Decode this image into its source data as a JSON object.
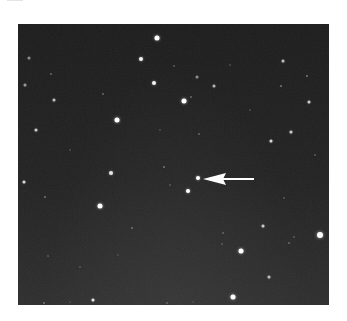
{
  "image": {
    "subject": "star field with arrow marking a single object",
    "panel": {
      "x": 18,
      "y": 24,
      "width": 311,
      "height": 281,
      "background": "#202020"
    },
    "arrow": {
      "direction": "left",
      "color": "#ffffff",
      "tip": {
        "x": 203,
        "y": 179
      },
      "head_base_x": 226,
      "head_half_height": 6,
      "shaft_end_x": 254,
      "shaft_thickness": 2
    },
    "target_star": {
      "x": 198,
      "y": 178,
      "size": 4
    },
    "stars": [
      {
        "x": 157,
        "y": 38,
        "size": 5,
        "brightness": 1.0
      },
      {
        "x": 141,
        "y": 59,
        "size": 4,
        "brightness": 0.95
      },
      {
        "x": 154,
        "y": 83,
        "size": 4,
        "brightness": 0.95
      },
      {
        "x": 117,
        "y": 120,
        "size": 5,
        "brightness": 1.0
      },
      {
        "x": 29,
        "y": 58,
        "size": 3,
        "brightness": 0.55
      },
      {
        "x": 25,
        "y": 85,
        "size": 3,
        "brightness": 0.6
      },
      {
        "x": 54,
        "y": 100,
        "size": 3,
        "brightness": 0.75
      },
      {
        "x": 36,
        "y": 130,
        "size": 3,
        "brightness": 0.8
      },
      {
        "x": 51,
        "y": 74,
        "size": 2,
        "brightness": 0.4
      },
      {
        "x": 103,
        "y": 94,
        "size": 2,
        "brightness": 0.4
      },
      {
        "x": 184,
        "y": 101,
        "size": 5,
        "brightness": 1.0
      },
      {
        "x": 197,
        "y": 77,
        "size": 3,
        "brightness": 0.55
      },
      {
        "x": 214,
        "y": 86,
        "size": 3,
        "brightness": 0.7
      },
      {
        "x": 283,
        "y": 61,
        "size": 3,
        "brightness": 0.75
      },
      {
        "x": 307,
        "y": 76,
        "size": 2,
        "brightness": 0.45
      },
      {
        "x": 281,
        "y": 86,
        "size": 2,
        "brightness": 0.45
      },
      {
        "x": 309,
        "y": 102,
        "size": 3,
        "brightness": 0.8
      },
      {
        "x": 291,
        "y": 132,
        "size": 3,
        "brightness": 0.8
      },
      {
        "x": 271,
        "y": 141,
        "size": 3,
        "brightness": 0.85
      },
      {
        "x": 174,
        "y": 66,
        "size": 2,
        "brightness": 0.35
      },
      {
        "x": 191,
        "y": 97,
        "size": 2,
        "brightness": 0.4
      },
      {
        "x": 199,
        "y": 134,
        "size": 2,
        "brightness": 0.4
      },
      {
        "x": 24,
        "y": 182,
        "size": 3,
        "brightness": 0.85
      },
      {
        "x": 111,
        "y": 173,
        "size": 4,
        "brightness": 0.9
      },
      {
        "x": 100,
        "y": 206,
        "size": 5,
        "brightness": 1.0
      },
      {
        "x": 164,
        "y": 167,
        "size": 2,
        "brightness": 0.45
      },
      {
        "x": 45,
        "y": 197,
        "size": 2,
        "brightness": 0.45
      },
      {
        "x": 132,
        "y": 228,
        "size": 2,
        "brightness": 0.45
      },
      {
        "x": 170,
        "y": 185,
        "size": 2,
        "brightness": 0.35
      },
      {
        "x": 80,
        "y": 267,
        "size": 2,
        "brightness": 0.35
      },
      {
        "x": 48,
        "y": 256,
        "size": 2,
        "brightness": 0.35
      },
      {
        "x": 188,
        "y": 191,
        "size": 4,
        "brightness": 1.0
      },
      {
        "x": 263,
        "y": 226,
        "size": 3,
        "brightness": 0.8
      },
      {
        "x": 320,
        "y": 235,
        "size": 6,
        "brightness": 1.0
      },
      {
        "x": 241,
        "y": 251,
        "size": 5,
        "brightness": 1.0
      },
      {
        "x": 269,
        "y": 277,
        "size": 3,
        "brightness": 0.75
      },
      {
        "x": 233,
        "y": 297,
        "size": 5,
        "brightness": 1.0
      },
      {
        "x": 223,
        "y": 233,
        "size": 2,
        "brightness": 0.4
      },
      {
        "x": 222,
        "y": 244,
        "size": 2,
        "brightness": 0.35
      },
      {
        "x": 289,
        "y": 243,
        "size": 2,
        "brightness": 0.4
      },
      {
        "x": 294,
        "y": 237,
        "size": 2,
        "brightness": 0.35
      },
      {
        "x": 284,
        "y": 198,
        "size": 2,
        "brightness": 0.35
      },
      {
        "x": 93,
        "y": 300,
        "size": 3,
        "brightness": 0.9
      },
      {
        "x": 44,
        "y": 303,
        "size": 2,
        "brightness": 0.45
      },
      {
        "x": 167,
        "y": 303,
        "size": 2,
        "brightness": 0.4
      },
      {
        "x": 70,
        "y": 302,
        "size": 2,
        "brightness": 0.3
      },
      {
        "x": 193,
        "y": 302,
        "size": 2,
        "brightness": 0.3
      },
      {
        "x": 118,
        "y": 255,
        "size": 2,
        "brightness": 0.3
      },
      {
        "x": 160,
        "y": 130,
        "size": 2,
        "brightness": 0.3
      },
      {
        "x": 250,
        "y": 110,
        "size": 2,
        "brightness": 0.3
      },
      {
        "x": 70,
        "y": 150,
        "size": 2,
        "brightness": 0.3
      },
      {
        "x": 315,
        "y": 155,
        "size": 2,
        "brightness": 0.35
      },
      {
        "x": 230,
        "y": 65,
        "size": 2,
        "brightness": 0.3
      }
    ]
  }
}
